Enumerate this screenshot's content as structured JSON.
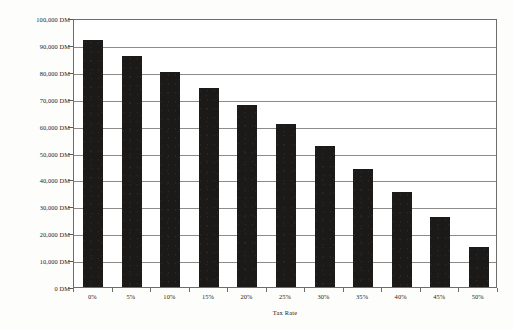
{
  "chart_data": {
    "type": "bar",
    "title": "",
    "xlabel": "Tax Rate",
    "ylabel": "Value of Equity",
    "categories": [
      "0%",
      "5%",
      "10%",
      "15%",
      "20%",
      "25%",
      "30%",
      "35%",
      "40%",
      "45%",
      "50%"
    ],
    "values": [
      92000,
      86000,
      80000,
      74000,
      67500,
      60500,
      52500,
      44000,
      35500,
      26000,
      15000
    ],
    "ylim": [
      0,
      100000
    ],
    "ytick_values": [
      0,
      10000,
      20000,
      30000,
      40000,
      50000,
      60000,
      70000,
      80000,
      90000,
      100000
    ],
    "ytick_labels": [
      "0 DM",
      "10,000 DM",
      "20,000 DM",
      "30,000 DM",
      "40,000 DM",
      "50,000 DM",
      "60,000 DM",
      "70,000 DM",
      "80,000 DM",
      "90,000 DM",
      "100,000 DM"
    ],
    "unit": "DM",
    "grid": true,
    "legend": false,
    "bar_color": "#1c1a19",
    "gridline_color": "#8d8b89",
    "frame_color": "#6e6c6a",
    "background_color": "#ffffff"
  }
}
